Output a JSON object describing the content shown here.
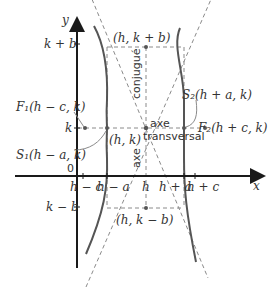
{
  "diagram": {
    "colors": {
      "axis": "#1a1a1a",
      "curve": "#555555",
      "dashed": "#8a8a8a",
      "text": "#333333",
      "point": "#555555"
    },
    "axes": {
      "x_label": "x",
      "y_label": "y",
      "origin_label": "0"
    },
    "y_ticks": [
      "k + b",
      "k",
      "k − b"
    ],
    "x_ticks": [
      "h − c",
      "h − a",
      "h",
      "h + a",
      "h + c"
    ],
    "points": {
      "center": "(h, k)",
      "top_conjugate": "(h, k + b)",
      "bottom_conjugate": "(h, k − b)",
      "focus1": "F₁(h − c, k)",
      "focus2": "F₂(h + c, k)",
      "vertex1": "S₁(h − a, k)",
      "vertex2": "S₂(h + a, k)"
    },
    "labels": {
      "conjugate_axis": "axe conjugué",
      "conjugate_axis_word1": "conjugué",
      "conjugate_axis_word2": "axe",
      "transverse_axis_word1": "axe",
      "transverse_axis_word2": "transversal"
    }
  }
}
